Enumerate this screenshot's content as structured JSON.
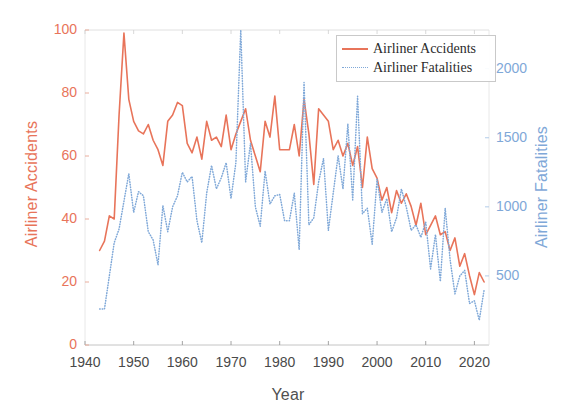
{
  "chart_data": {
    "type": "line",
    "title": "",
    "xlabel": "Year",
    "ylabel": "Airliner Accidents",
    "ylabel_right": "Airliner Fatalities",
    "xlim": [
      1940,
      2023
    ],
    "ylim": [
      0,
      100
    ],
    "ylim_right": [
      0,
      2280
    ],
    "xticks": [
      1940,
      1950,
      1960,
      1970,
      1980,
      1990,
      2000,
      2010,
      2020
    ],
    "yticks_left": [
      0,
      20,
      40,
      60,
      80,
      100
    ],
    "yticks_right": [
      500,
      1000,
      1500,
      2000
    ],
    "grid": false,
    "legend_position": "top-right",
    "colors": {
      "accidents": "#e8745a",
      "fatalities": "#7fa8d8",
      "axis": "#4a4a4a",
      "background": "#ffffff"
    },
    "series": [
      {
        "name": "Airliner Accidents",
        "axis": "left",
        "style": "solid",
        "color": "#e8745a",
        "x": [
          1943,
          1944,
          1945,
          1946,
          1947,
          1948,
          1949,
          1950,
          1951,
          1952,
          1953,
          1954,
          1955,
          1956,
          1957,
          1958,
          1959,
          1960,
          1961,
          1962,
          1963,
          1964,
          1965,
          1966,
          1967,
          1968,
          1969,
          1970,
          1971,
          1972,
          1973,
          1974,
          1975,
          1976,
          1977,
          1978,
          1979,
          1980,
          1981,
          1982,
          1983,
          1984,
          1985,
          1986,
          1987,
          1988,
          1989,
          1990,
          1991,
          1992,
          1993,
          1994,
          1995,
          1996,
          1997,
          1998,
          1999,
          2000,
          2001,
          2002,
          2003,
          2004,
          2005,
          2006,
          2007,
          2008,
          2009,
          2010,
          2011,
          2012,
          2013,
          2014,
          2015,
          2016,
          2017,
          2018,
          2019,
          2020,
          2021,
          2022
        ],
        "values": [
          30,
          33,
          41,
          40,
          73,
          99,
          78,
          71,
          68,
          67,
          70,
          65,
          62,
          57,
          71,
          73,
          77,
          76,
          64,
          61,
          66,
          59,
          71,
          65,
          66,
          63,
          73,
          62,
          67,
          71,
          75,
          65,
          60,
          55,
          71,
          66,
          79,
          62,
          62,
          62,
          70,
          60,
          78,
          67,
          51,
          75,
          73,
          71,
          62,
          65,
          60,
          64,
          57,
          63,
          50,
          66,
          56,
          53,
          46,
          50,
          42,
          49,
          45,
          48,
          44,
          38,
          45,
          35,
          38,
          41,
          35,
          36,
          30,
          34,
          25,
          29,
          22,
          16,
          23,
          20
        ]
      },
      {
        "name": "Airliner Fatalities",
        "axis": "right",
        "style": "dotted",
        "color": "#7fa8d8",
        "x": [
          1943,
          1944,
          1945,
          1946,
          1947,
          1948,
          1949,
          1950,
          1951,
          1952,
          1953,
          1954,
          1955,
          1956,
          1957,
          1958,
          1959,
          1960,
          1961,
          1962,
          1963,
          1964,
          1965,
          1966,
          1967,
          1968,
          1969,
          1970,
          1971,
          1972,
          1973,
          1974,
          1975,
          1976,
          1977,
          1978,
          1979,
          1980,
          1981,
          1982,
          1983,
          1984,
          1985,
          1986,
          1987,
          1988,
          1989,
          1990,
          1991,
          1992,
          1993,
          1994,
          1995,
          1996,
          1997,
          1998,
          1999,
          2000,
          2001,
          2002,
          2003,
          2004,
          2005,
          2006,
          2007,
          2008,
          2009,
          2010,
          2011,
          2012,
          2013,
          2014,
          2015,
          2016,
          2017,
          2018,
          2019,
          2020,
          2021,
          2022
        ],
        "values": [
          260,
          260,
          500,
          740,
          840,
          1040,
          1240,
          960,
          1110,
          1080,
          820,
          760,
          580,
          1010,
          820,
          1000,
          1080,
          1250,
          1180,
          1220,
          900,
          740,
          1100,
          1300,
          1130,
          1210,
          1320,
          1060,
          1320,
          2280,
          1180,
          1460,
          1000,
          860,
          1260,
          1020,
          1080,
          1090,
          900,
          900,
          1100,
          690,
          1900,
          870,
          920,
          1180,
          1350,
          830,
          1100,
          1370,
          1130,
          1600,
          1050,
          1800,
          950,
          990,
          730,
          1200,
          960,
          1060,
          820,
          920,
          1130,
          1000,
          830,
          870,
          780,
          890,
          550,
          800,
          460,
          990,
          620,
          370,
          500,
          540,
          300,
          320,
          180,
          400
        ]
      }
    ]
  },
  "legend": {
    "items": [
      {
        "label": "Airliner Accidents",
        "style": "solid",
        "color": "#e8745a"
      },
      {
        "label": "Airliner Fatalities",
        "style": "dotted",
        "color": "#7fa8d8"
      }
    ]
  }
}
